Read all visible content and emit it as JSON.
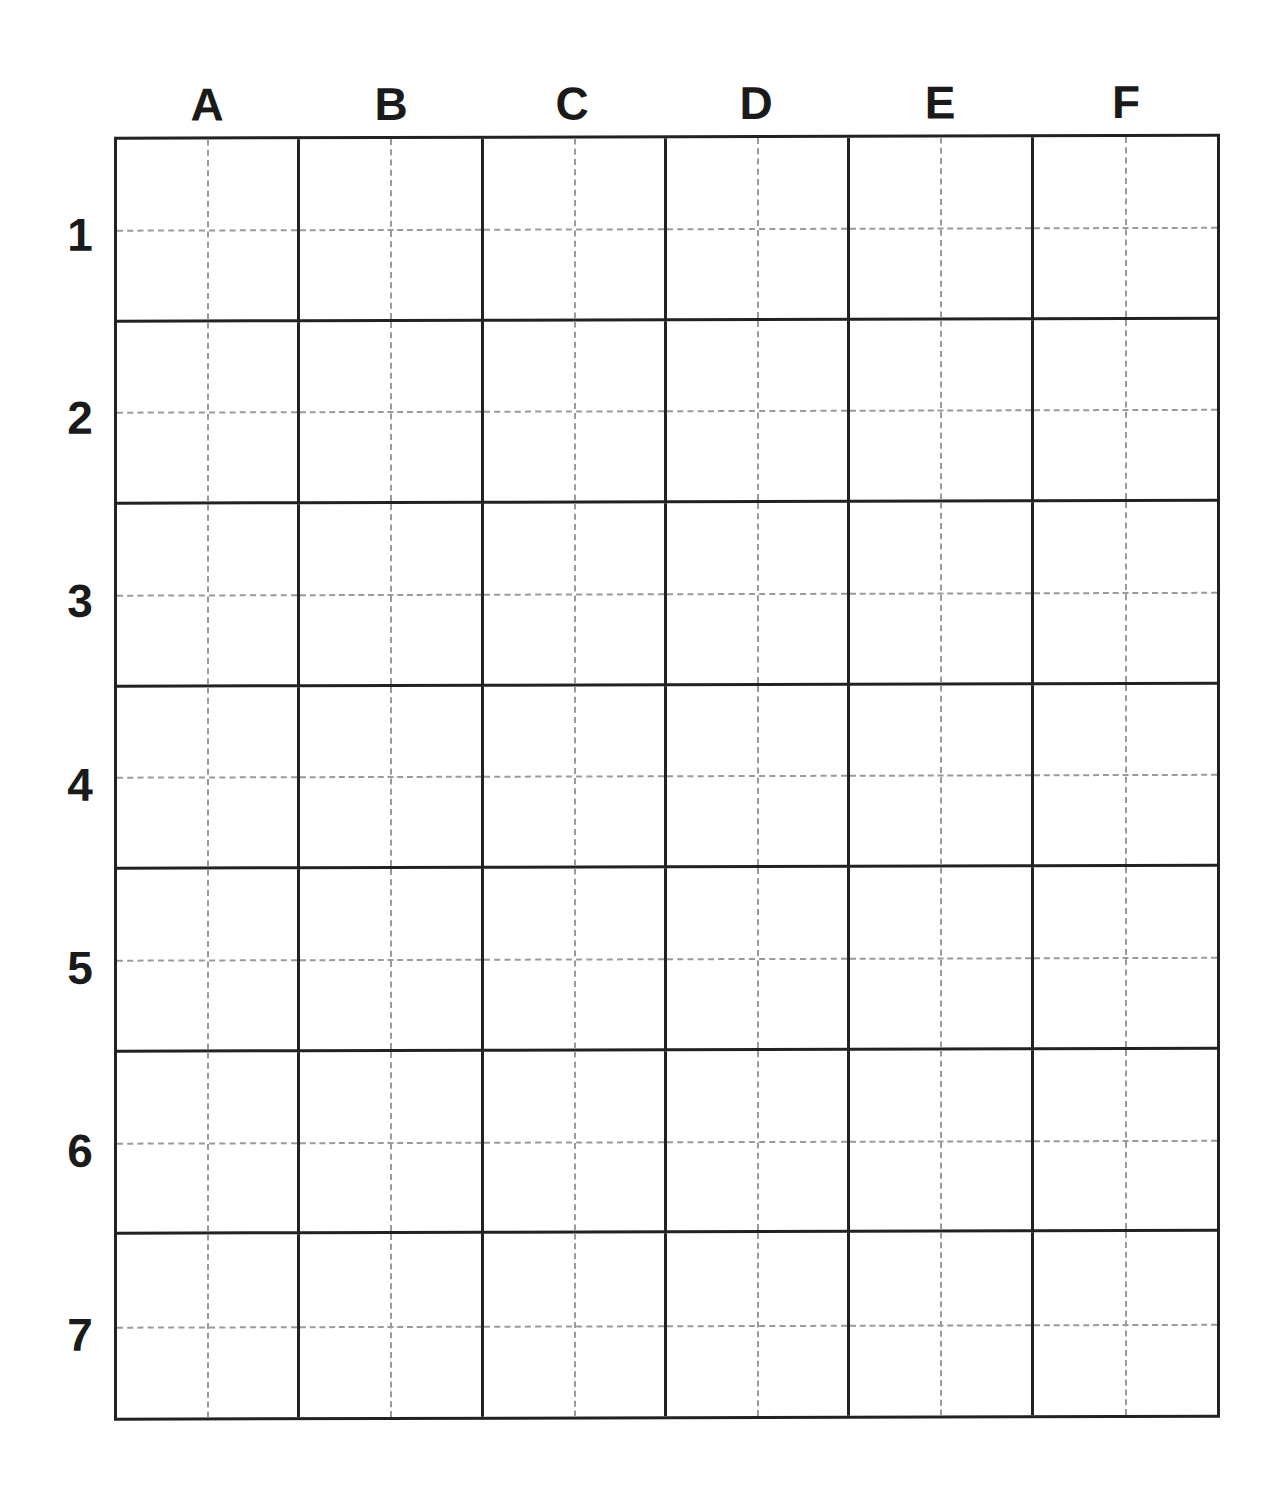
{
  "diagram": {
    "type": "labeled-grid",
    "columns": [
      "A",
      "B",
      "C",
      "D",
      "E",
      "F"
    ],
    "rows": [
      "1",
      "2",
      "3",
      "4",
      "5",
      "6",
      "7"
    ],
    "cell_guides": "dashed-midlines",
    "colors": {
      "grid_line": "#222222",
      "guide_line": "#9a9a9a",
      "label": "#1a1a1a",
      "background": "#ffffff"
    }
  }
}
